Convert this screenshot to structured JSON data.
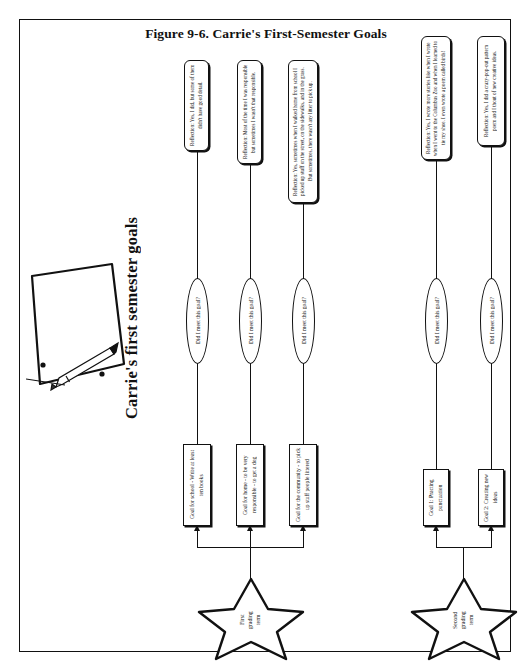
{
  "figure": {
    "caption": "Figure 9-6. Carrie's First-Semester Goals",
    "diagram_title": "Carrie's first semester goals",
    "decision_label": "Did I meet this goal?"
  },
  "illustration": {
    "name": "paper-and-pencil-sketch",
    "description": "Hand-drawn sheet of paper with three-hole punch and a pencil"
  },
  "terms": [
    {
      "id": "first-grading-term",
      "label": "First\ngrading\nterm",
      "goals": [
        {
          "id": "goal-school",
          "text": "Goal for school - Write at least ten books",
          "decision": "Did I meet this goal?",
          "reflection": "Reflection: Yes, I did, but some of them didn't have good detail."
        },
        {
          "id": "goal-home",
          "text": "Goal for home - to be very responsible - to get a dog",
          "decision": "Did I meet this goal?",
          "reflection": "Reflection: Most of the time I was responsible but sometimes I wasn't that responsible."
        },
        {
          "id": "goal-community",
          "text": "Goal for the community - to pick up stuff people littered",
          "decision": "Did I meet this goal?",
          "reflection": "Reflection: Yes, sometimes when I walked home from school I picked up stuff on the street, on the sidewalks, and in the grass. But sometimes, there wasn't any litter to pick up."
        }
      ]
    },
    {
      "id": "second-grading-term",
      "label": "Second\ngrading\nterm",
      "goals": [
        {
          "id": "goal-1-punctuation",
          "text": "Goal 1: Practing punctuation",
          "decision": "Did I meet this goal?",
          "reflection": "Reflection: Yes, I wrote more stories like when I wrote when I went to the Columbus Zoo and when I learned to tie my shoe. I even wrote a poem called birds!"
        },
        {
          "id": "goal-2-new-ideas",
          "text": "Goal 2: Creating new ideas",
          "decision": "Did I meet this goal?",
          "reflection": "Reflection: Yes, I did a crazy-pop-out pattern poem and I thout of new creative ideas."
        }
      ]
    }
  ],
  "colors": {
    "ink": "#111111",
    "paper": "#ffffff"
  }
}
